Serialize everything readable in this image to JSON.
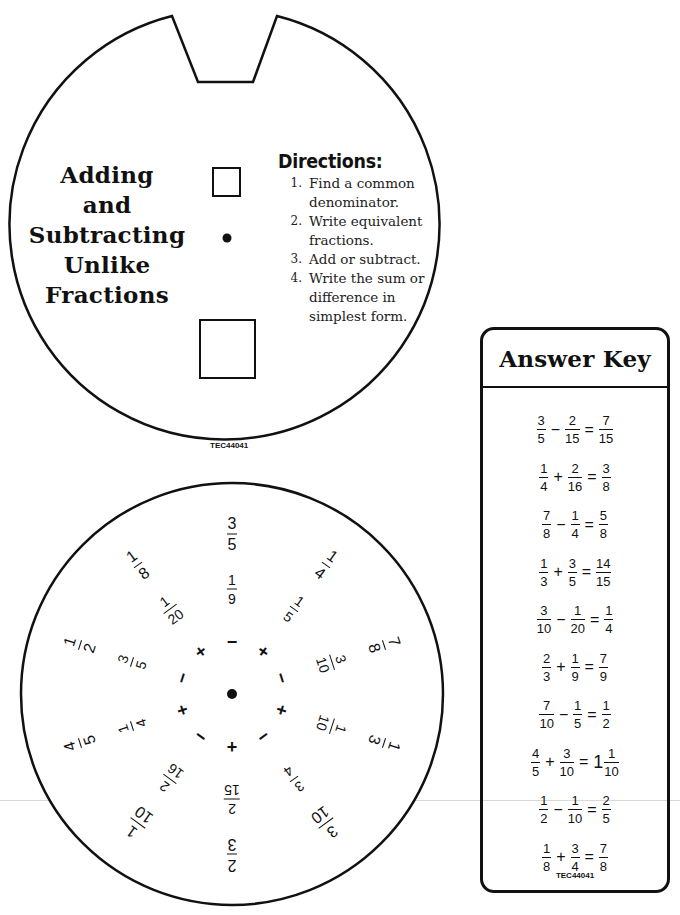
{
  "top_wheel": {
    "title_lines": [
      "Adding",
      "and",
      "Subtracting",
      "Unlike",
      "Fractions"
    ],
    "directions": {
      "heading": "Directions:",
      "steps": [
        {
          "num": "1.",
          "text": "Find a common denominator."
        },
        {
          "num": "2.",
          "text": "Write equivalent fractions."
        },
        {
          "num": "3.",
          "text": "Add or subtract."
        },
        {
          "num": "4.",
          "text": "Write the sum or difference in simplest form."
        }
      ]
    },
    "code": "TEC44041"
  },
  "bottom_wheel": {
    "outer_ring": [
      {
        "angle": 0,
        "num": "3",
        "den": "5"
      },
      {
        "angle": 36,
        "num": "1",
        "den": "4"
      },
      {
        "angle": 72,
        "num": "7",
        "den": "8"
      },
      {
        "angle": 108,
        "num": "1",
        "den": "3"
      },
      {
        "angle": 144,
        "num": "3",
        "den": "10"
      },
      {
        "angle": 180,
        "num": "2",
        "den": "3"
      },
      {
        "angle": 216,
        "num": "1",
        "den": "10"
      },
      {
        "angle": 252,
        "num": "4",
        "den": "5"
      },
      {
        "angle": 288,
        "num": "1",
        "den": "2"
      },
      {
        "angle": 324,
        "num": "1",
        "den": "8"
      }
    ],
    "inner_ring": [
      {
        "angle": 0,
        "num": "1",
        "den": "9"
      },
      {
        "angle": 36,
        "num": "1",
        "den": "5"
      },
      {
        "angle": 72,
        "num": "3",
        "den": "10"
      },
      {
        "angle": 108,
        "num": "1",
        "den": "10"
      },
      {
        "angle": 144,
        "num": "3",
        "den": "4"
      },
      {
        "angle": 180,
        "num": "2",
        "den": "15"
      },
      {
        "angle": 216,
        "num": "2",
        "den": "16"
      },
      {
        "angle": 252,
        "num": "1",
        "den": "4"
      },
      {
        "angle": 288,
        "num": "3",
        "den": "5"
      },
      {
        "angle": 324,
        "num": "1",
        "den": "20"
      }
    ],
    "operators": [
      {
        "angle": 0,
        "sym": "−"
      },
      {
        "angle": 36,
        "sym": "+"
      },
      {
        "angle": 72,
        "sym": "−"
      },
      {
        "angle": 108,
        "sym": "+"
      },
      {
        "angle": 144,
        "sym": "−"
      },
      {
        "angle": 180,
        "sym": "+"
      },
      {
        "angle": 216,
        "sym": "−"
      },
      {
        "angle": 252,
        "sym": "+"
      },
      {
        "angle": 288,
        "sym": "−"
      },
      {
        "angle": 324,
        "sym": "+"
      }
    ]
  },
  "answer_key": {
    "title": "Answer Key",
    "equations": [
      {
        "a": [
          "3",
          "5"
        ],
        "op": "−",
        "b": [
          "2",
          "15"
        ],
        "result": {
          "whole": "",
          "num": "7",
          "den": "15"
        }
      },
      {
        "a": [
          "1",
          "4"
        ],
        "op": "+",
        "b": [
          "2",
          "16"
        ],
        "result": {
          "whole": "",
          "num": "3",
          "den": "8"
        }
      },
      {
        "a": [
          "7",
          "8"
        ],
        "op": "−",
        "b": [
          "1",
          "4"
        ],
        "result": {
          "whole": "",
          "num": "5",
          "den": "8"
        }
      },
      {
        "a": [
          "1",
          "3"
        ],
        "op": "+",
        "b": [
          "3",
          "5"
        ],
        "result": {
          "whole": "",
          "num": "14",
          "den": "15"
        }
      },
      {
        "a": [
          "3",
          "10"
        ],
        "op": "−",
        "b": [
          "1",
          "20"
        ],
        "result": {
          "whole": "",
          "num": "1",
          "den": "4"
        }
      },
      {
        "a": [
          "2",
          "3"
        ],
        "op": "+",
        "b": [
          "1",
          "9"
        ],
        "result": {
          "whole": "",
          "num": "7",
          "den": "9"
        }
      },
      {
        "a": [
          "7",
          "10"
        ],
        "op": "−",
        "b": [
          "1",
          "5"
        ],
        "result": {
          "whole": "",
          "num": "1",
          "den": "2"
        }
      },
      {
        "a": [
          "4",
          "5"
        ],
        "op": "+",
        "b": [
          "3",
          "10"
        ],
        "result": {
          "whole": "1",
          "num": "1",
          "den": "10"
        }
      },
      {
        "a": [
          "1",
          "2"
        ],
        "op": "−",
        "b": [
          "1",
          "10"
        ],
        "result": {
          "whole": "",
          "num": "2",
          "den": "5"
        }
      },
      {
        "a": [
          "1",
          "8"
        ],
        "op": "+",
        "b": [
          "3",
          "4"
        ],
        "result": {
          "whole": "",
          "num": "7",
          "den": "8"
        }
      }
    ],
    "eq_symbol": "=",
    "code": "TEC44041"
  }
}
